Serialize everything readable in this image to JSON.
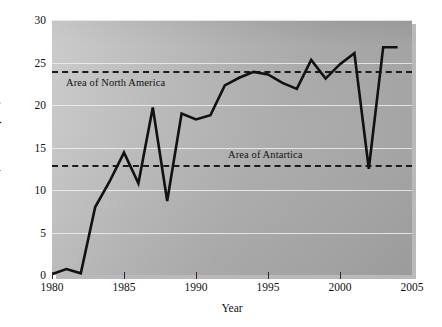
{
  "chart_data": {
    "type": "line",
    "title": "",
    "xlabel": "Year",
    "ylabel": "Size (million Sq km)",
    "xlim": [
      1980,
      2005
    ],
    "ylim": [
      0,
      30
    ],
    "xticks": [
      1980,
      1985,
      1990,
      1995,
      2000,
      2005
    ],
    "yticks": [
      0,
      5,
      10,
      15,
      20,
      25,
      30
    ],
    "grid": true,
    "legend_position": "none",
    "series": [
      {
        "name": "Ozone hole area",
        "x": [
          1980,
          1981,
          1982,
          1983,
          1984,
          1985,
          1986,
          1987,
          1988,
          1989,
          1990,
          1991,
          1992,
          1993,
          1994,
          1995,
          1996,
          1997,
          1998,
          1999,
          2000,
          2001,
          2002,
          2003,
          2004
        ],
        "values": [
          0.1,
          0.7,
          0.2,
          8.0,
          11.0,
          14.4,
          10.8,
          19.7,
          8.7,
          19.0,
          18.3,
          18.8,
          22.3,
          23.2,
          23.9,
          23.6,
          22.6,
          21.9,
          25.3,
          23.1,
          24.8,
          26.1,
          12.5,
          26.8,
          26.8
        ]
      }
    ],
    "reference_lines": [
      {
        "label": "Area of North America",
        "value": 24.0,
        "style": "dashed"
      },
      {
        "label": "Area of Antartica",
        "value": 13.0,
        "style": "dashed"
      }
    ],
    "colors": {
      "series_line": "#111111",
      "reference_line": "#1c1c1c",
      "gridline": "#efefef",
      "plot_background": "#a9a9a9",
      "text": "#111111"
    }
  }
}
